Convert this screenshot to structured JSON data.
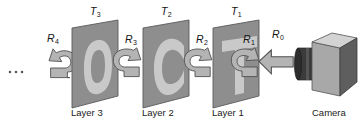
{
  "figure": {
    "type": "diagram",
    "background_color": "#ffffff",
    "ellipsis": "· · ·"
  },
  "layers": [
    {
      "id": "layer3",
      "caption": "Layer 3",
      "transmittance_label": "T",
      "transmittance_sub": "3",
      "glyph": "O",
      "plane_fill": "#8e8e8e",
      "glyph_fill": "#c9c9c9"
    },
    {
      "id": "layer2",
      "caption": "Layer 2",
      "transmittance_label": "T",
      "transmittance_sub": "2",
      "glyph": "C",
      "plane_fill": "#8e8e8e",
      "glyph_fill": "#c9c9c9"
    },
    {
      "id": "layer1",
      "caption": "Layer 1",
      "transmittance_label": "T",
      "transmittance_sub": "1",
      "glyph": "T",
      "plane_fill": "#8e8e8e",
      "glyph_fill": "#c9c9c9"
    }
  ],
  "rays": [
    {
      "id": "r0",
      "label": "R",
      "sub": "0",
      "kind": "straight-arrow-left",
      "fill": "#b4b4b4"
    },
    {
      "id": "r1",
      "label": "R",
      "sub": "1",
      "kind": "hook-arrow",
      "fill": "#b4b4b4"
    },
    {
      "id": "r2",
      "label": "R",
      "sub": "2",
      "kind": "hook-arrow",
      "fill": "#b4b4b4"
    },
    {
      "id": "r3",
      "label": "R",
      "sub": "3",
      "kind": "hook-arrow",
      "fill": "#b4b4b4"
    },
    {
      "id": "r4",
      "label": "R",
      "sub": "4",
      "kind": "hook-arrow",
      "fill": "#b4b4b4"
    }
  ],
  "camera": {
    "caption": "Camera",
    "body_top_fill": "#d3d3d3",
    "body_front_fill": "#a8a8a8",
    "body_side_fill": "#5e5e5e",
    "lens_fill": "#3a3a3a"
  }
}
